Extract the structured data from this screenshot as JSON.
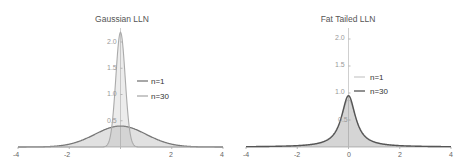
{
  "chart_data": [
    {
      "type": "area",
      "title": "Gaussian LLN",
      "xlabel": "",
      "ylabel": "",
      "xlim": [
        -4,
        4
      ],
      "ylim": [
        0,
        2.2
      ],
      "x_ticks": [
        "-4",
        "-2",
        "0",
        "2",
        "4"
      ],
      "y_ticks": [
        "0.5",
        "1.0",
        "1.5",
        "2.0"
      ],
      "grid": false,
      "legend_position": "center-right",
      "series": [
        {
          "name": "n=1",
          "distribution": "normal",
          "sd": 1.0,
          "peak": 0.399,
          "color": "#777777"
        },
        {
          "name": "n=30",
          "distribution": "normal",
          "sd": 0.1826,
          "peak": 2.185,
          "color": "#aaaaaa"
        }
      ]
    },
    {
      "type": "area",
      "title": "Fat Tailed LLN",
      "xlabel": "",
      "ylabel": "",
      "xlim": [
        -4,
        4
      ],
      "ylim": [
        0,
        2.2
      ],
      "x_ticks": [
        "-4",
        "-2",
        "0",
        "2",
        "4"
      ],
      "y_ticks": [
        "0.5",
        "1.0",
        "1.5",
        "2.0"
      ],
      "grid": false,
      "legend_position": "center-right",
      "series": [
        {
          "name": "n=1",
          "distribution": "fat-tailed",
          "scale": 0.36,
          "peak": 0.88,
          "color": "#cccccc"
        },
        {
          "name": "n=30",
          "distribution": "fat-tailed",
          "scale": 0.33,
          "peak": 0.95,
          "color": "#555555"
        }
      ]
    }
  ],
  "left": {
    "title": "Gaussian LLN",
    "legend": [
      "n=1",
      "n=30"
    ]
  },
  "right": {
    "title": "Fat Tailed LLN",
    "legend": [
      "n=1",
      "n=30"
    ]
  },
  "axes": {
    "x_ticks": [
      "-4",
      "-2",
      "0",
      "2",
      "4"
    ],
    "y_ticks": [
      "0.5",
      "1.0",
      "1.5",
      "2.0"
    ]
  }
}
